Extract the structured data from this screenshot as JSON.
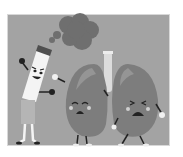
{
  "image": {
    "alt": "Cartoon illustration: an angry cigarette character blowing smoke at a pair of crying lungs",
    "style": "grayscale",
    "colors": {
      "background": "#a3a3a3",
      "border": "#d8d8d8",
      "smoke": "#6f6f6f",
      "lung": "#7d7d7d",
      "lung_highlight": "#959595",
      "cigarette": "#f4f4f4",
      "filter": "#b5b5b5",
      "outline": "#222222"
    },
    "characters": [
      {
        "name": "cigarette",
        "expression": "angry"
      },
      {
        "name": "left-lung",
        "expression": "crying"
      },
      {
        "name": "right-lung",
        "expression": "crying"
      }
    ]
  }
}
